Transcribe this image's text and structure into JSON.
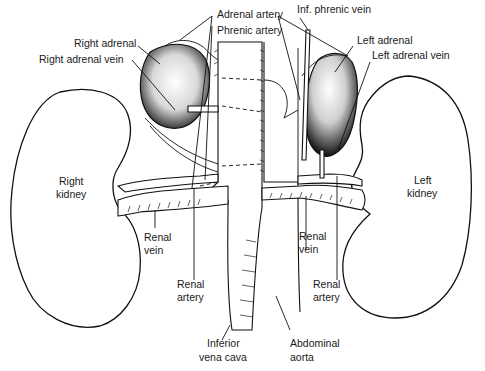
{
  "figure": {
    "labels": {
      "adrenal_artery": "Adrenal artery",
      "phrenic_artery": "Phrenic artery",
      "inf_phrenic_vein": "Inf. phrenic vein",
      "right_adrenal": "Right adrenal",
      "right_adrenal_vein": "Right adrenal vein",
      "left_adrenal": "Left adrenal",
      "left_adrenal_vein": "Left adrenal vein",
      "right_kidney_1": "Right",
      "right_kidney_2": "kidney",
      "left_kidney_1": "Left",
      "left_kidney_2": "kidney",
      "right_renal_vein_1": "Renal",
      "right_renal_vein_2": "vein",
      "right_renal_artery_1": "Renal",
      "right_renal_artery_2": "artery",
      "left_renal_vein_1": "Renal",
      "left_renal_vein_2": "vein",
      "left_renal_artery_1": "Renal",
      "left_renal_artery_2": "artery",
      "ivc_1": "Inferior",
      "ivc_2": "vena cava",
      "aorta_1": "Abdominal",
      "aorta_2": "aorta"
    }
  }
}
